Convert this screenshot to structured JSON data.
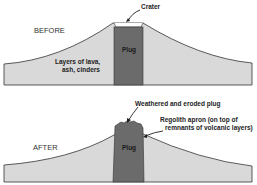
{
  "before": {
    "stage_label": "BEFORE",
    "crater_label": "Crater",
    "plug_label": "Plug",
    "layers_label_line1": "Layers of lava,",
    "layers_label_line2": "ash, cinders"
  },
  "after": {
    "stage_label": "AFTER",
    "plug_label": "Plug",
    "eroded_label": "Weathered and eroded plug",
    "regolith_label_line1": "Regolith apron (on top of",
    "regolith_label_line2": "remnants of volcanic layers)"
  },
  "colors": {
    "cone_fill": "#d9d9d9",
    "plug_fill": "#6b6b6b",
    "outline": "#333333"
  }
}
